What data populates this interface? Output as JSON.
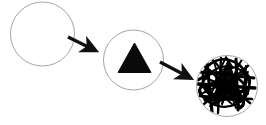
{
  "diagram": {
    "type": "process-flow",
    "width": 266,
    "height": 125,
    "background_color": "#ffffff",
    "stroke_color_outline": "#9a9a9a",
    "fill_color_shape": "#000000",
    "arrow_color": "#111111",
    "stages": [
      {
        "id": "stage-1",
        "label": "",
        "description": "empty circle outline",
        "cx": 42.5,
        "cy": 34,
        "r": 32,
        "contents": "none"
      },
      {
        "id": "stage-2",
        "label": "",
        "description": "circle containing a solid black triangle",
        "cx": 133.5,
        "cy": 60,
        "r": 30,
        "contents": "triangle"
      },
      {
        "id": "stage-3",
        "label": "",
        "description": "circle containing a triangle obscured by dense scribbles",
        "cx": 227,
        "cy": 86,
        "r": 31,
        "contents": "triangle-with-scribble"
      }
    ],
    "arrows": [
      {
        "id": "arrow-1",
        "label": "",
        "from": "stage-1",
        "to": "stage-2",
        "x1": 68,
        "y1": 37,
        "x2": 99,
        "y2": 52
      },
      {
        "id": "arrow-2",
        "label": "",
        "from": "stage-2",
        "to": "stage-3",
        "x1": 160,
        "y1": 62,
        "x2": 194,
        "y2": 80
      }
    ]
  }
}
